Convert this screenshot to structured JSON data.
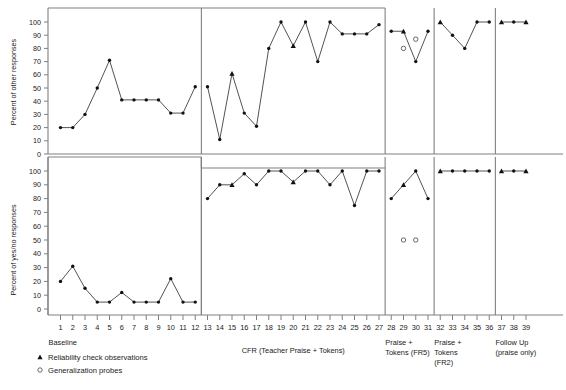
{
  "figure": {
    "upper_axis_title": "Percent of other responses",
    "lower_axis_title": "Percent of yes/no responses",
    "y_ticks": [
      0,
      10,
      20,
      30,
      40,
      50,
      60,
      70,
      80,
      90,
      100
    ],
    "x_ticks": [
      1,
      2,
      3,
      4,
      5,
      6,
      7,
      8,
      9,
      10,
      11,
      12,
      13,
      14,
      15,
      16,
      17,
      18,
      19,
      20,
      21,
      22,
      23,
      24,
      25,
      26,
      27,
      28,
      29,
      30,
      31,
      32,
      33,
      34,
      35,
      36,
      37,
      38,
      39
    ]
  },
  "phases": [
    {
      "name": "baseline",
      "label": "Baseline",
      "start": 1,
      "end": 12
    },
    {
      "name": "cfr",
      "label": "CFR (Teacher Praise + Tokens)",
      "start": 13,
      "end": 27
    },
    {
      "name": "fr5",
      "label": "Praise +\nTokens (FR5)",
      "label_line1": "Praise +",
      "label_line2": "Tokens (FR5)",
      "start": 28,
      "end": 31
    },
    {
      "name": "fr2",
      "label": "Praise + Tokens (FR2)",
      "label_line1": "Praise +",
      "label_line2": "Tokens",
      "label_line3": "(FR2)",
      "start": 32,
      "end": 36
    },
    {
      "name": "followup",
      "label": "Follow Up (praise only)",
      "label_line1": "Follow Up",
      "label_line2": "(praise only)",
      "start": 37,
      "end": 39
    }
  ],
  "legend": [
    {
      "name": "reliability",
      "marker": "triangle-marker",
      "label": "Reliability check observations"
    },
    {
      "name": "generalization",
      "marker": "open-circle-marker",
      "label": "Generalization probes"
    }
  ],
  "chart_data": {
    "type": "line",
    "title": "",
    "xlabel": "",
    "ylim": [
      0,
      100
    ],
    "grid": false,
    "legend_position": "bottom-left",
    "panels": [
      {
        "name": "upper-panel",
        "ylabel": "Percent of other responses",
        "series": [
          {
            "name": "other-responses",
            "x": [
              1,
              2,
              3,
              4,
              5,
              6,
              7,
              8,
              9,
              10,
              11,
              12,
              13,
              14,
              15,
              16,
              17,
              18,
              19,
              20,
              21,
              22,
              23,
              24,
              25,
              26,
              27,
              28,
              29,
              30,
              31,
              32,
              33,
              34,
              35,
              36,
              37,
              38,
              39
            ],
            "values": [
              20,
              20,
              30,
              50,
              71,
              41,
              41,
              41,
              41,
              31,
              31,
              51,
              51,
              11,
              61,
              31,
              21,
              80,
              100,
              82,
              100,
              70,
              100,
              91,
              91,
              91,
              98,
              93,
              93,
              70,
              93,
              100,
              90,
              80,
              100,
              100,
              100,
              100,
              100
            ],
            "markers": [
              "dot",
              "dot",
              "dot",
              "dot",
              "dot",
              "dot",
              "dot",
              "dot",
              "dot",
              "dot",
              "dot",
              "dot",
              "dot",
              "dot",
              "triangle",
              "dot",
              "dot",
              "dot",
              "dot",
              "triangle",
              "dot",
              "dot",
              "dot",
              "dot",
              "dot",
              "dot",
              "dot",
              "dot",
              "triangle",
              "dot",
              "dot",
              "triangle",
              "dot",
              "dot",
              "dot",
              "dot",
              "triangle",
              "dot",
              "triangle"
            ]
          }
        ],
        "probes": [
          {
            "x": 29.0,
            "value": 80
          },
          {
            "x": 30.0,
            "value": 87
          }
        ]
      },
      {
        "name": "lower-panel",
        "ylabel": "Percent of yes/no responses",
        "series": [
          {
            "name": "yes-no-responses",
            "x": [
              1,
              2,
              3,
              4,
              5,
              6,
              7,
              8,
              9,
              10,
              11,
              12,
              13,
              14,
              15,
              16,
              17,
              18,
              19,
              20,
              21,
              22,
              23,
              24,
              25,
              26,
              27,
              28,
              29,
              30,
              31,
              32,
              33,
              34,
              35,
              36,
              37,
              38,
              39
            ],
            "values": [
              20,
              31,
              15,
              5,
              5,
              12,
              5,
              5,
              5,
              22,
              5,
              5,
              80,
              90,
              90,
              98,
              90,
              100,
              100,
              92,
              100,
              100,
              90,
              100,
              75,
              100,
              100,
              80,
              90,
              100,
              80,
              100,
              100,
              100,
              100,
              100,
              100,
              100,
              100
            ],
            "markers": [
              "dot",
              "dot",
              "dot",
              "dot",
              "dot",
              "dot",
              "dot",
              "dot",
              "dot",
              "dot",
              "dot",
              "dot",
              "dot",
              "dot",
              "triangle",
              "dot",
              "dot",
              "dot",
              "dot",
              "triangle",
              "dot",
              "dot",
              "dot",
              "dot",
              "dot",
              "dot",
              "dot",
              "dot",
              "triangle",
              "dot",
              "dot",
              "triangle",
              "dot",
              "dot",
              "dot",
              "dot",
              "triangle",
              "dot",
              "triangle"
            ]
          }
        ],
        "probes": [
          {
            "x": 29.0,
            "value": 50
          },
          {
            "x": 30.0,
            "value": 50
          }
        ]
      }
    ]
  }
}
